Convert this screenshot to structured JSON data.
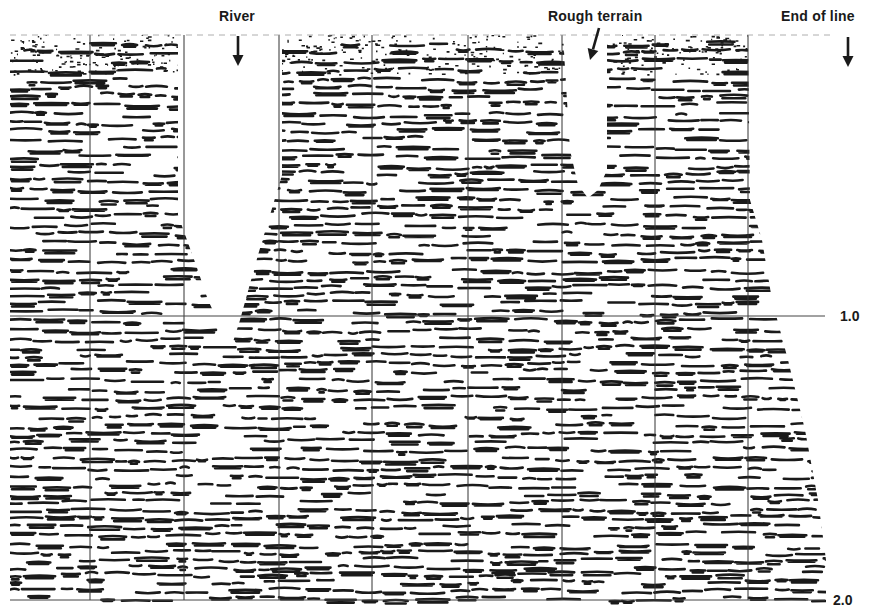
{
  "figure": {
    "type": "seismic-section",
    "background": "#ffffff",
    "ink": "#1a1a1a",
    "data_region": {
      "left": 10,
      "right": 830,
      "top": 35,
      "bottom": 600
    }
  },
  "annotations": [
    {
      "id": "river",
      "text": "River",
      "label_x": 219,
      "label_y": 8,
      "arrow": {
        "x1": 238,
        "y1": 36,
        "x2": 238,
        "y2": 66
      }
    },
    {
      "id": "rough-terrain",
      "text": "Rough terrain",
      "label_x": 548,
      "label_y": 8,
      "arrow": {
        "x1": 599,
        "y1": 28,
        "x2": 590,
        "y2": 60
      }
    },
    {
      "id": "end-of-line",
      "text": "End of line",
      "label_x": 781,
      "label_y": 8,
      "arrow": {
        "x1": 848,
        "y1": 37,
        "x2": 848,
        "y2": 67
      }
    }
  ],
  "time_axis": {
    "unit": "s",
    "ticks": [
      {
        "label": "1.0",
        "y": 316,
        "label_x": 840,
        "line_from": 10,
        "line_to": 825
      },
      {
        "label": "2.0",
        "y": 600,
        "label_x": 833,
        "line_from": 10,
        "line_to": 825
      }
    ]
  },
  "trace_gridlines_x": [
    90,
    184,
    279,
    372,
    468,
    562,
    655,
    748
  ],
  "mute_zones": [
    {
      "id": "river-gap",
      "polygon": [
        [
          178,
          35
        ],
        [
          282,
          35
        ],
        [
          282,
          175
        ],
        [
          258,
          255
        ],
        [
          240,
          320
        ],
        [
          232,
          345
        ],
        [
          222,
          330
        ],
        [
          208,
          300
        ],
        [
          196,
          265
        ],
        [
          178,
          215
        ]
      ]
    },
    {
      "id": "rough-terrain-gap",
      "polygon": [
        [
          563,
          35
        ],
        [
          607,
          35
        ],
        [
          607,
          170
        ],
        [
          598,
          190
        ],
        [
          588,
          198
        ],
        [
          578,
          185
        ],
        [
          570,
          150
        ]
      ]
    },
    {
      "id": "right-taper",
      "polygon": [
        [
          748,
          35
        ],
        [
          871,
          35
        ],
        [
          871,
          615
        ],
        [
          826,
          615
        ],
        [
          826,
          560
        ],
        [
          818,
          500
        ],
        [
          805,
          430
        ],
        [
          788,
          360
        ],
        [
          772,
          300
        ],
        [
          762,
          240
        ],
        [
          750,
          200
        ]
      ]
    },
    {
      "id": "left-top-fade",
      "polygon": [
        [
          0,
          35
        ],
        [
          10,
          35
        ],
        [
          10,
          615
        ],
        [
          0,
          615
        ]
      ]
    }
  ]
}
